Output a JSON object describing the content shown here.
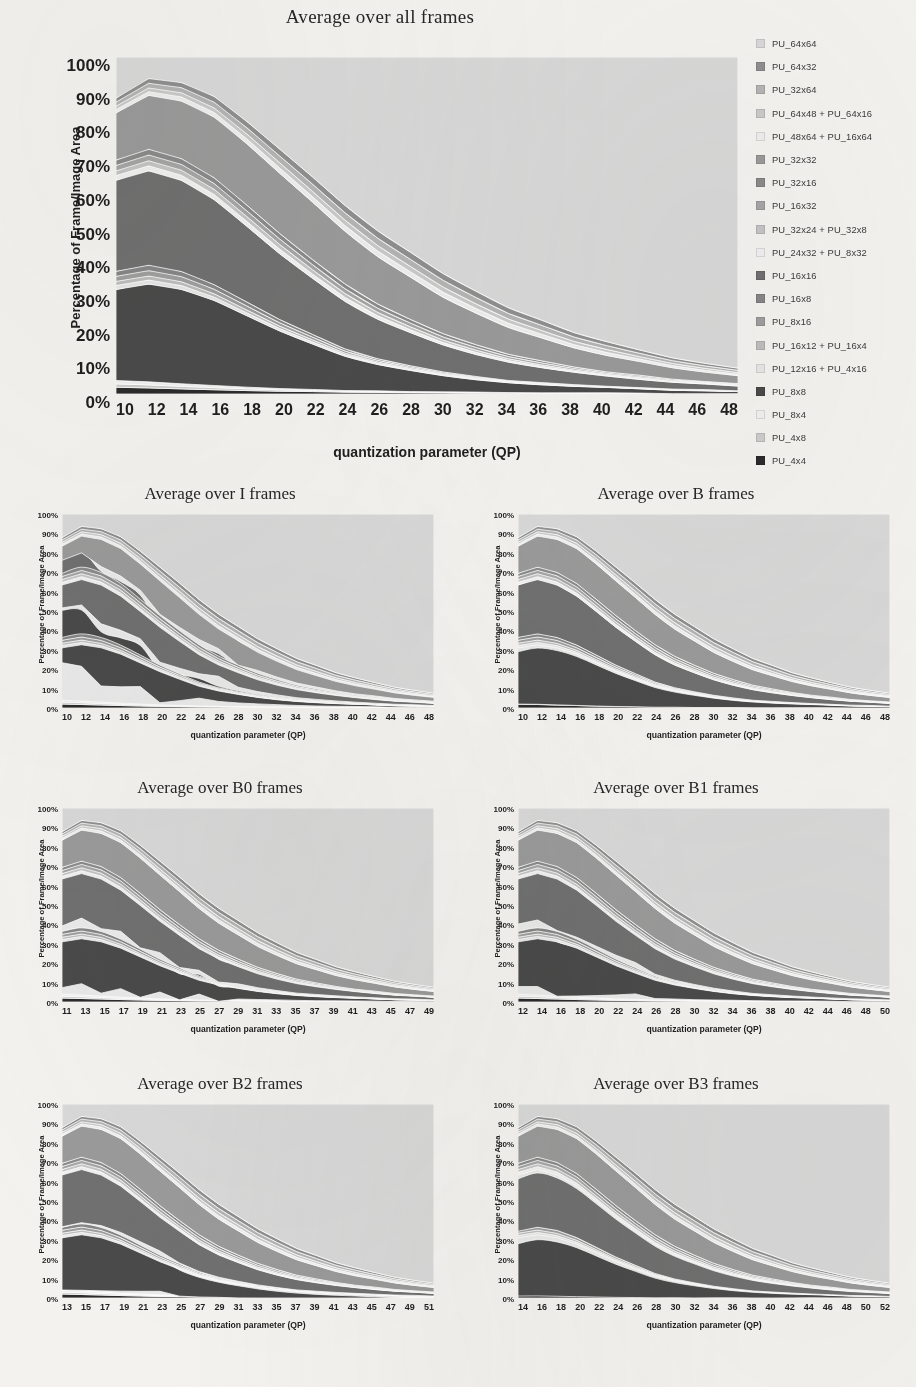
{
  "figure": {
    "main_title": "Average over all frames",
    "ylabel": "Percentage of Frame/Image Area",
    "xlabel": "quantization parameter (QP)",
    "ytick_labels": [
      "100%",
      "90%",
      "80%",
      "70%",
      "60%",
      "50%",
      "40%",
      "30%",
      "20%",
      "10%",
      "0%"
    ]
  },
  "legend": {
    "items": [
      {
        "label": "PU_64x64",
        "color": "#d8d8d8"
      },
      {
        "label": "PU_64x32",
        "color": "#8f8f8f"
      },
      {
        "label": "PU_32x64",
        "color": "#b4b4b4"
      },
      {
        "label": "PU_64x48 + PU_64x16",
        "color": "#c9c9c9"
      },
      {
        "label": "PU_48x64 + PU_16x64",
        "color": "#ededed"
      },
      {
        "label": "PU_32x32",
        "color": "#9a9a9a"
      },
      {
        "label": "PU_32x16",
        "color": "#8a8a8a"
      },
      {
        "label": "PU_16x32",
        "color": "#a5a5a5"
      },
      {
        "label": "PU_32x24 + PU_32x8",
        "color": "#c4c4c4"
      },
      {
        "label": "PU_24x32 + PU_8x32",
        "color": "#efefef"
      },
      {
        "label": "PU_16x16",
        "color": "#707070"
      },
      {
        "label": "PU_16x8",
        "color": "#868686"
      },
      {
        "label": "PU_8x16",
        "color": "#9e9e9e"
      },
      {
        "label": "PU_16x12 + PU_16x4",
        "color": "#bdbdbd"
      },
      {
        "label": "PU_12x16 + PU_4x16",
        "color": "#e6e6e6"
      },
      {
        "label": "PU_8x8",
        "color": "#4a4a4a"
      },
      {
        "label": "PU_8x4",
        "color": "#efefef"
      },
      {
        "label": "PU_4x8",
        "color": "#cccccc"
      },
      {
        "label": "PU_4x4",
        "color": "#2b2b2b"
      }
    ]
  },
  "subplots": [
    {
      "id": "I",
      "title": "Average over I frames",
      "xticks": [
        "10",
        "12",
        "14",
        "16",
        "18",
        "20",
        "22",
        "24",
        "26",
        "28",
        "30",
        "32",
        "34",
        "36",
        "38",
        "40",
        "42",
        "44",
        "46",
        "48"
      ]
    },
    {
      "id": "B",
      "title": "Average over B frames",
      "xticks": [
        "10",
        "12",
        "14",
        "16",
        "18",
        "20",
        "22",
        "24",
        "26",
        "28",
        "30",
        "32",
        "34",
        "36",
        "38",
        "40",
        "42",
        "44",
        "46",
        "48"
      ]
    },
    {
      "id": "B0",
      "title": "Average over B0 frames",
      "xticks": [
        "11",
        "13",
        "15",
        "17",
        "19",
        "21",
        "23",
        "25",
        "27",
        "29",
        "31",
        "33",
        "35",
        "37",
        "39",
        "41",
        "43",
        "45",
        "47",
        "49"
      ]
    },
    {
      "id": "B1",
      "title": "Average over B1 frames",
      "xticks": [
        "12",
        "14",
        "16",
        "18",
        "20",
        "22",
        "24",
        "26",
        "28",
        "30",
        "32",
        "34",
        "36",
        "38",
        "40",
        "42",
        "44",
        "46",
        "48",
        "50"
      ]
    },
    {
      "id": "B2",
      "title": "Average over B2 frames",
      "xticks": [
        "13",
        "15",
        "17",
        "19",
        "21",
        "23",
        "25",
        "27",
        "29",
        "31",
        "33",
        "35",
        "37",
        "39",
        "41",
        "43",
        "45",
        "47",
        "49",
        "51"
      ]
    },
    {
      "id": "B3",
      "title": "Average over B3 frames",
      "xticks": [
        "14",
        "16",
        "18",
        "20",
        "22",
        "24",
        "26",
        "28",
        "30",
        "32",
        "34",
        "36",
        "38",
        "40",
        "42",
        "44",
        "46",
        "48",
        "50",
        "52"
      ]
    }
  ],
  "chart_data": {
    "type": "area",
    "stacked": true,
    "title": "Average over all frames",
    "xlabel": "quantization parameter (QP)",
    "ylabel": "Percentage of Frame/Image Area",
    "ylim": [
      0,
      100
    ],
    "grid": false,
    "legend_position": "right",
    "note": "Stacked area charts of HEVC prediction-unit (PU) partition usage as percentage of frame/image area versus quantization parameter. Series are ordered bottom-to-top: smallest PUs at the bottom, PU_64x64 at the top; total always sums to 100%.",
    "charts": [
      {
        "name": "Average over all frames",
        "x": [
          10,
          12,
          14,
          16,
          18,
          20,
          22,
          24,
          26,
          28,
          30,
          32,
          34,
          36,
          38,
          40,
          42,
          44,
          46,
          48
        ],
        "series": [
          {
            "name": "PU_4x4",
            "values": [
              2.0,
              1.8,
              1.6,
              1.4,
              1.2,
              1.0,
              0.9,
              0.7,
              0.6,
              0.5,
              0.4,
              0.3,
              0.3,
              0.2,
              0.2,
              0.2,
              0.1,
              0.1,
              0.1,
              0.1
            ]
          },
          {
            "name": "PU_4x8",
            "values": [
              1.0,
              0.9,
              0.8,
              0.7,
              0.6,
              0.5,
              0.4,
              0.3,
              0.3,
              0.2,
              0.2,
              0.2,
              0.1,
              0.1,
              0.1,
              0.1,
              0.1,
              0.0,
              0.0,
              0.0
            ]
          },
          {
            "name": "PU_8x4",
            "values": [
              1.0,
              0.9,
              0.8,
              0.7,
              0.6,
              0.5,
              0.4,
              0.3,
              0.3,
              0.2,
              0.2,
              0.2,
              0.1,
              0.1,
              0.1,
              0.1,
              0.1,
              0.0,
              0.0,
              0.0
            ]
          },
          {
            "name": "PU_8x8",
            "values": [
              27.0,
              29.0,
              29.5,
              28.0,
              25.0,
              21.0,
              17.0,
              13.0,
              10.0,
              8.0,
              6.0,
              4.5,
              3.5,
              2.8,
              2.2,
              1.8,
              1.4,
              1.1,
              0.9,
              0.7
            ]
          },
          {
            "name": "PU_12x16 + PU_4x16",
            "values": [
              1.2,
              1.2,
              1.2,
              1.1,
              1.0,
              0.9,
              0.8,
              0.6,
              0.5,
              0.4,
              0.3,
              0.3,
              0.2,
              0.2,
              0.1,
              0.1,
              0.1,
              0.1,
              0.1,
              0.0
            ]
          },
          {
            "name": "PU_16x12 + PU_16x4",
            "values": [
              1.2,
              1.2,
              1.2,
              1.1,
              1.0,
              0.9,
              0.8,
              0.6,
              0.5,
              0.4,
              0.3,
              0.3,
              0.2,
              0.2,
              0.1,
              0.1,
              0.1,
              0.1,
              0.1,
              0.0
            ]
          },
          {
            "name": "PU_8x16",
            "values": [
              1.5,
              1.6,
              1.6,
              1.5,
              1.4,
              1.2,
              1.0,
              0.8,
              0.6,
              0.5,
              0.4,
              0.3,
              0.2,
              0.2,
              0.2,
              0.1,
              0.1,
              0.1,
              0.1,
              0.1
            ]
          },
          {
            "name": "PU_16x8",
            "values": [
              1.5,
              1.6,
              1.6,
              1.5,
              1.4,
              1.2,
              1.0,
              0.8,
              0.6,
              0.5,
              0.4,
              0.3,
              0.2,
              0.2,
              0.2,
              0.1,
              0.1,
              0.1,
              0.1,
              0.1
            ]
          },
          {
            "name": "PU_16x16",
            "values": [
              27.0,
              28.0,
              28.5,
              28.0,
              26.5,
              24.0,
              21.0,
              18.0,
              15.0,
              12.5,
              10.0,
              8.0,
              6.5,
              5.2,
              4.2,
              3.4,
              2.7,
              2.2,
              1.8,
              1.5
            ]
          },
          {
            "name": "PU_24x32 + PU_8x32",
            "values": [
              1.4,
              1.5,
              1.6,
              1.7,
              1.7,
              1.7,
              1.6,
              1.5,
              1.3,
              1.1,
              0.9,
              0.8,
              0.6,
              0.5,
              0.4,
              0.3,
              0.3,
              0.2,
              0.2,
              0.2
            ]
          },
          {
            "name": "PU_32x24 + PU_32x8",
            "values": [
              1.4,
              1.5,
              1.6,
              1.7,
              1.7,
              1.7,
              1.6,
              1.5,
              1.3,
              1.1,
              0.9,
              0.8,
              0.6,
              0.5,
              0.4,
              0.3,
              0.3,
              0.2,
              0.2,
              0.2
            ]
          },
          {
            "name": "PU_16x32",
            "values": [
              1.6,
              1.7,
              1.8,
              1.9,
              2.0,
              2.0,
              1.9,
              1.8,
              1.6,
              1.4,
              1.2,
              1.0,
              0.8,
              0.7,
              0.5,
              0.4,
              0.4,
              0.3,
              0.2,
              0.2
            ]
          },
          {
            "name": "PU_32x16",
            "values": [
              1.6,
              1.7,
              1.8,
              1.9,
              2.0,
              2.0,
              1.9,
              1.8,
              1.6,
              1.4,
              1.2,
              1.0,
              0.8,
              0.7,
              0.5,
              0.4,
              0.4,
              0.3,
              0.2,
              0.2
            ]
          },
          {
            "name": "PU_32x32",
            "values": [
              14.0,
              16.0,
              18.0,
              20.0,
              21.5,
              22.0,
              21.5,
              20.0,
              18.0,
              16.0,
              13.5,
              11.5,
              9.5,
              8.0,
              6.5,
              5.5,
              4.5,
              3.7,
              3.0,
              2.5
            ]
          },
          {
            "name": "PU_48x64 + PU_16x64",
            "values": [
              1.0,
              1.1,
              1.3,
              1.5,
              1.7,
              1.9,
              2.0,
              2.1,
              2.1,
              2.0,
              1.9,
              1.7,
              1.5,
              1.3,
              1.1,
              1.0,
              0.8,
              0.7,
              0.6,
              0.5
            ]
          },
          {
            "name": "PU_64x48 + PU_64x16",
            "values": [
              1.0,
              1.1,
              1.3,
              1.5,
              1.7,
              1.9,
              2.0,
              2.1,
              2.1,
              2.0,
              1.9,
              1.7,
              1.5,
              1.3,
              1.1,
              1.0,
              0.8,
              0.7,
              0.6,
              0.5
            ]
          },
          {
            "name": "PU_32x64",
            "values": [
              1.2,
              1.4,
              1.6,
              1.9,
              2.2,
              2.5,
              2.7,
              2.8,
              2.8,
              2.7,
              2.5,
              2.3,
              2.0,
              1.8,
              1.5,
              1.3,
              1.1,
              0.9,
              0.8,
              0.7
            ]
          },
          {
            "name": "PU_64x32",
            "values": [
              1.2,
              1.4,
              1.6,
              1.9,
              2.2,
              2.5,
              2.7,
              2.8,
              2.8,
              2.7,
              2.5,
              2.3,
              2.0,
              1.8,
              1.5,
              1.3,
              1.1,
              0.9,
              0.8,
              0.7
            ]
          },
          {
            "name": "PU_64x64",
            "values": [
              12.2,
              6.4,
              8.0,
              13.0,
              22.6,
              33.6,
              44.8,
              56.3,
              66.1,
              73.9,
              80.5,
              85.5,
              89.2,
              91.9,
              93.9,
              95.4,
              96.5,
              97.4,
              98.0,
              98.5
            ]
          }
        ]
      }
    ]
  }
}
